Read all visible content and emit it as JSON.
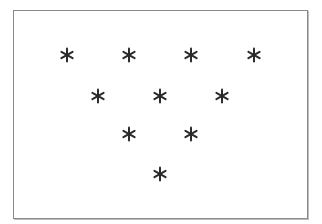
{
  "diagram": {
    "symbol": "asterisk-icon",
    "symbol_color": "#2b2b2b",
    "frame_color": "#8a8a8a",
    "rows": [
      {
        "count": 4,
        "points": [
          {
            "x": 67,
            "y": 55
          },
          {
            "x": 129,
            "y": 55
          },
          {
            "x": 191,
            "y": 55
          },
          {
            "x": 254,
            "y": 55
          }
        ]
      },
      {
        "count": 3,
        "points": [
          {
            "x": 98,
            "y": 96
          },
          {
            "x": 160,
            "y": 96
          },
          {
            "x": 222,
            "y": 96
          }
        ]
      },
      {
        "count": 2,
        "points": [
          {
            "x": 129,
            "y": 134
          },
          {
            "x": 191,
            "y": 134
          }
        ]
      },
      {
        "count": 1,
        "points": [
          {
            "x": 160,
            "y": 174
          }
        ]
      }
    ],
    "total_symbols": 10
  }
}
